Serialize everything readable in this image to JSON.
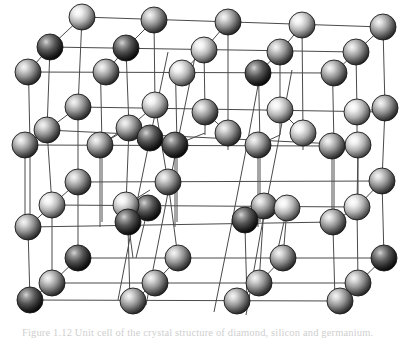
{
  "figure": {
    "caption": "Figure 1.12  Unit cell of the crystal structure of diamond, silicon and germanium.",
    "caption_visible": "clipped",
    "background_color": "#ffffff",
    "bond_color": "#4a4a4a",
    "bond_width": 1,
    "sphere": {
      "radius": 13,
      "highlight_color": "#f2f2f2",
      "mid_color": "#9a9a9a",
      "edge_color": "#2e2e2e",
      "outline_color": "#1a1a1a",
      "highlight_offset_x": -0.32,
      "highlight_offset_y": -0.34
    },
    "tones": {
      "light": {
        "name": "light",
        "highlight": "#fbfbfb",
        "mid": "#b9b9b9",
        "edge": "#3b3b3b"
      },
      "medium": {
        "name": "medium",
        "highlight": "#ededed",
        "mid": "#8f8f8f",
        "edge": "#2b2b2b"
      },
      "dark": {
        "name": "dark",
        "highlight": "#c9c9c9",
        "mid": "#5a5a5a",
        "edge": "#141414"
      }
    }
  },
  "chart_data": {
    "type": "scatter",
    "xlabel": "",
    "ylabel": "",
    "xlim": [
      0,
      415
    ],
    "ylim": [
      0,
      338
    ],
    "grid": false,
    "legend": "none",
    "projection": {
      "axis_a": {
        "name": "horizontal",
        "dx": 72,
        "dy": 0
      },
      "axis_b": {
        "name": "receding-depth",
        "dx": 34,
        "dy": -28
      },
      "axis_c": {
        "name": "vertical",
        "dx": -4,
        "dy": 73
      }
    },
    "atoms": [
      {
        "id": 1,
        "x": 82,
        "y": 17,
        "tone": "light",
        "r": 13
      },
      {
        "id": 2,
        "x": 154,
        "y": 20,
        "tone": "medium",
        "r": 13
      },
      {
        "id": 3,
        "x": 228,
        "y": 22,
        "tone": "medium",
        "r": 13
      },
      {
        "id": 4,
        "x": 302,
        "y": 25,
        "tone": "light",
        "r": 13
      },
      {
        "id": 5,
        "x": 383,
        "y": 27,
        "tone": "medium",
        "r": 13
      },
      {
        "id": 6,
        "x": 50,
        "y": 47,
        "tone": "dark",
        "r": 13
      },
      {
        "id": 7,
        "x": 126,
        "y": 48,
        "tone": "dark",
        "r": 13
      },
      {
        "id": 8,
        "x": 204,
        "y": 50,
        "tone": "light",
        "r": 13
      },
      {
        "id": 9,
        "x": 280,
        "y": 52,
        "tone": "medium",
        "r": 13
      },
      {
        "id": 10,
        "x": 356,
        "y": 52,
        "tone": "medium",
        "r": 13
      },
      {
        "id": 11,
        "x": 28,
        "y": 72,
        "tone": "medium",
        "r": 13
      },
      {
        "id": 12,
        "x": 106,
        "y": 72,
        "tone": "medium",
        "r": 13
      },
      {
        "id": 13,
        "x": 182,
        "y": 73,
        "tone": "light",
        "r": 13
      },
      {
        "id": 14,
        "x": 258,
        "y": 73,
        "tone": "dark",
        "r": 13
      },
      {
        "id": 15,
        "x": 334,
        "y": 73,
        "tone": "medium",
        "r": 13
      },
      {
        "id": 16,
        "x": 78,
        "y": 107,
        "tone": "medium",
        "r": 13
      },
      {
        "id": 17,
        "x": 155,
        "y": 105,
        "tone": "light",
        "r": 13
      },
      {
        "id": 18,
        "x": 205,
        "y": 112,
        "tone": "medium",
        "r": 13
      },
      {
        "id": 19,
        "x": 280,
        "y": 110,
        "tone": "light",
        "r": 13
      },
      {
        "id": 20,
        "x": 357,
        "y": 112,
        "tone": "light",
        "r": 13
      },
      {
        "id": 21,
        "x": 385,
        "y": 108,
        "tone": "medium",
        "r": 13
      },
      {
        "id": 22,
        "x": 47,
        "y": 130,
        "tone": "medium",
        "r": 13
      },
      {
        "id": 23,
        "x": 129,
        "y": 128,
        "tone": "medium",
        "r": 13
      },
      {
        "id": 24,
        "x": 150,
        "y": 138,
        "tone": "dark",
        "r": 13
      },
      {
        "id": 25,
        "x": 228,
        "y": 133,
        "tone": "medium",
        "r": 13
      },
      {
        "id": 26,
        "x": 303,
        "y": 133,
        "tone": "light",
        "r": 13
      },
      {
        "id": 27,
        "x": 358,
        "y": 145,
        "tone": "light",
        "r": 13
      },
      {
        "id": 28,
        "x": 25,
        "y": 145,
        "tone": "medium",
        "r": 13
      },
      {
        "id": 29,
        "x": 100,
        "y": 145,
        "tone": "medium",
        "r": 13
      },
      {
        "id": 30,
        "x": 175,
        "y": 145,
        "tone": "dark",
        "r": 13
      },
      {
        "id": 31,
        "x": 258,
        "y": 145,
        "tone": "medium",
        "r": 13
      },
      {
        "id": 32,
        "x": 332,
        "y": 146,
        "tone": "medium",
        "r": 13
      },
      {
        "id": 33,
        "x": 78,
        "y": 182,
        "tone": "medium",
        "r": 13
      },
      {
        "id": 34,
        "x": 168,
        "y": 182,
        "tone": "medium",
        "r": 13
      },
      {
        "id": 35,
        "x": 148,
        "y": 208,
        "tone": "dark",
        "r": 13
      },
      {
        "id": 36,
        "x": 264,
        "y": 206,
        "tone": "medium",
        "r": 13
      },
      {
        "id": 37,
        "x": 382,
        "y": 181,
        "tone": "medium",
        "r": 13
      },
      {
        "id": 38,
        "x": 287,
        "y": 208,
        "tone": "light",
        "r": 13
      },
      {
        "id": 39,
        "x": 52,
        "y": 205,
        "tone": "light",
        "r": 13
      },
      {
        "id": 40,
        "x": 126,
        "y": 205,
        "tone": "light",
        "r": 13
      },
      {
        "id": 41,
        "x": 357,
        "y": 207,
        "tone": "light",
        "r": 13
      },
      {
        "id": 42,
        "x": 28,
        "y": 227,
        "tone": "medium",
        "r": 13
      },
      {
        "id": 43,
        "x": 128,
        "y": 222,
        "tone": "dark",
        "r": 13
      },
      {
        "id": 44,
        "x": 245,
        "y": 220,
        "tone": "dark",
        "r": 13
      },
      {
        "id": 45,
        "x": 333,
        "y": 222,
        "tone": "medium",
        "r": 13
      },
      {
        "id": 46,
        "x": 78,
        "y": 258,
        "tone": "dark",
        "r": 13
      },
      {
        "id": 47,
        "x": 178,
        "y": 258,
        "tone": "medium",
        "r": 13
      },
      {
        "id": 48,
        "x": 283,
        "y": 258,
        "tone": "medium",
        "r": 13
      },
      {
        "id": 49,
        "x": 384,
        "y": 258,
        "tone": "dark",
        "r": 13
      },
      {
        "id": 50,
        "x": 52,
        "y": 283,
        "tone": "medium",
        "r": 13
      },
      {
        "id": 51,
        "x": 155,
        "y": 283,
        "tone": "medium",
        "r": 13
      },
      {
        "id": 52,
        "x": 259,
        "y": 283,
        "tone": "medium",
        "r": 13
      },
      {
        "id": 53,
        "x": 358,
        "y": 283,
        "tone": "medium",
        "r": 13
      },
      {
        "id": 54,
        "x": 30,
        "y": 300,
        "tone": "dark",
        "r": 13
      },
      {
        "id": 55,
        "x": 133,
        "y": 301,
        "tone": "medium",
        "r": 13
      },
      {
        "id": 56,
        "x": 237,
        "y": 301,
        "tone": "medium",
        "r": 13
      },
      {
        "id": 57,
        "x": 340,
        "y": 301,
        "tone": "medium",
        "r": 13
      }
    ],
    "bond_count": 96
  }
}
